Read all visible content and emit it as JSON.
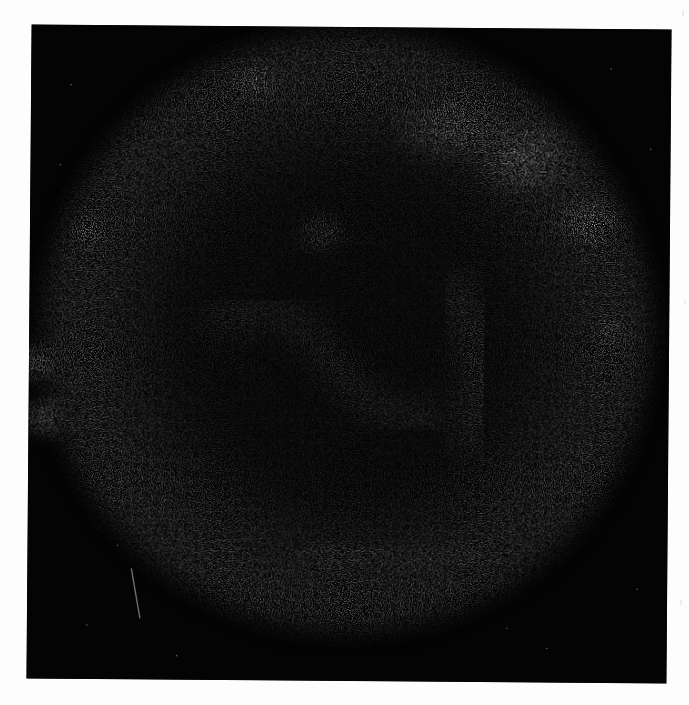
{
  "image": {
    "subject": "supernova remnant X-ray image",
    "description": "Grainy grayscale image of a roughly circular nebular shell with bright knots along the rim, dark interior, on a black background, scanned onto a white page",
    "colors": {
      "background_page": "#fdfdfd",
      "sky": "#040404",
      "shell_dim": "#5a5a5a",
      "shell_mid": "#8c8c8c",
      "knot_bright": "#f2f2f2"
    },
    "shell": {
      "center": [
        345,
        330
      ],
      "radius_x": 300,
      "radius_y": 300
    },
    "bright_knots": [
      {
        "name": "upper-right-knot",
        "x": 523,
        "y": 157,
        "r": 38,
        "intensity": 1.0
      },
      {
        "name": "right-knot",
        "x": 587,
        "y": 220,
        "r": 28,
        "intensity": 0.8
      },
      {
        "name": "upper-left-knot",
        "x": 253,
        "y": 82,
        "r": 18,
        "intensity": 0.75
      },
      {
        "name": "left-edge-knot-upper",
        "x": 37,
        "y": 365,
        "r": 16,
        "intensity": 0.85
      },
      {
        "name": "left-edge-knot-lower",
        "x": 45,
        "y": 420,
        "r": 18,
        "intensity": 0.85
      },
      {
        "name": "left-knot",
        "x": 88,
        "y": 235,
        "r": 16,
        "intensity": 0.55
      },
      {
        "name": "central-knot",
        "x": 320,
        "y": 233,
        "r": 22,
        "intensity": 0.45
      },
      {
        "name": "right-mid-knot",
        "x": 612,
        "y": 330,
        "r": 16,
        "intensity": 0.55
      }
    ],
    "streak": {
      "x1": 133,
      "y1": 570,
      "x2": 142,
      "y2": 620
    }
  }
}
